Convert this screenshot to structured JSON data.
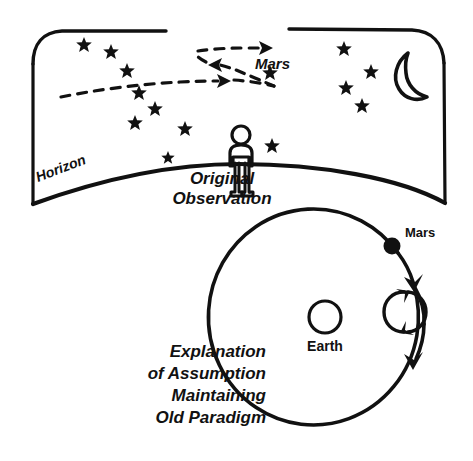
{
  "figure": {
    "ink_color": "#111111",
    "background_color": "#ffffff",
    "width": 473,
    "height": 461
  },
  "sky_panel": {
    "name": "night-sky-observation-panel",
    "horizon_label": "Horizon",
    "mars_label": "Mars",
    "caption_lines": [
      "Original",
      "Observation"
    ],
    "observer_label": "observer-figure",
    "moon_label": "crescent-moon",
    "star_count": 14,
    "stars": [
      {
        "x": 84,
        "y": 44,
        "size": 7
      },
      {
        "x": 111,
        "y": 51,
        "size": 7
      },
      {
        "x": 127,
        "y": 70,
        "size": 7
      },
      {
        "x": 139,
        "y": 92,
        "size": 7
      },
      {
        "x": 155,
        "y": 108,
        "size": 7
      },
      {
        "x": 135,
        "y": 122,
        "size": 7
      },
      {
        "x": 185,
        "y": 128,
        "size": 7
      },
      {
        "x": 168,
        "y": 157,
        "size": 6
      },
      {
        "x": 272,
        "y": 145,
        "size": 7
      },
      {
        "x": 270,
        "y": 72,
        "size": 7
      },
      {
        "x": 344,
        "y": 48,
        "size": 7
      },
      {
        "x": 371,
        "y": 71,
        "size": 7
      },
      {
        "x": 346,
        "y": 87,
        "size": 7
      },
      {
        "x": 362,
        "y": 105,
        "size": 7
      }
    ],
    "retrograde_paths": [
      {
        "name": "lower-eastward-path",
        "direction": "eastward"
      },
      {
        "name": "upper-westward-path",
        "direction": "westward"
      },
      {
        "name": "upper-resumed-eastward-path",
        "direction": "eastward"
      }
    ]
  },
  "orbit_panel": {
    "name": "epicycle-explanation-panel",
    "mars_label": "Mars",
    "earth_label": "Earth",
    "caption_lines": [
      "Explanation",
      "of Assumption",
      "Maintaining",
      "Old Paradigm"
    ],
    "deferent_label": "deferent-circle",
    "epicycle_label": "epicycle-circle",
    "mars_marker_label": "mars-body-marker"
  }
}
